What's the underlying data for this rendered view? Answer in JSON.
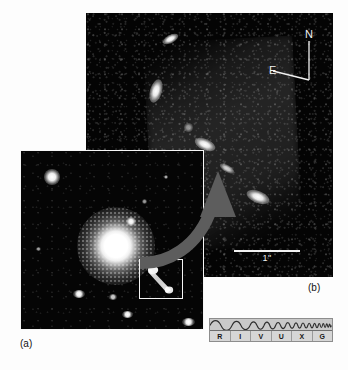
{
  "figure": {
    "type": "astronomical-image-figure",
    "panels": [
      {
        "id": "a",
        "label": "(a)",
        "caption_label": "(a)",
        "description": "Wide-field optical image of a bright elliptical galaxy with diffuse halo, surrounding field stars, and a white rectangular selection box marking the jet region",
        "background_color": "#050505",
        "selection_box_color": "#f4f4f4",
        "features": {
          "galaxy_core": "bright saturated nucleus",
          "halo": "diffuse mottled envelope",
          "selection_box": "white rectangle around jet",
          "field_stars": 9
        }
      },
      {
        "id": "b",
        "label": "(b)",
        "caption_label": "(b)",
        "description": "High-resolution zoom of the jet showing discrete bright knots strung along a diagonal ridge from upper-left to lower-right on a noisy dark background",
        "background_color": "#040404",
        "knot_count": 6
      }
    ],
    "compass": {
      "north_label": "N",
      "east_label": "E",
      "color": "#f2f2f2"
    },
    "scalebar": {
      "label": "1\"",
      "value": 1,
      "unit": "arcsec",
      "color": "#f0f0f0"
    },
    "callout_arrow": {
      "from_panel": "a",
      "to_panel": "b",
      "color": "#5d5d5d",
      "style": "curved-thick-arrow"
    },
    "spectrum_bar": {
      "title": "electromagnetic spectrum indicator",
      "bands": [
        {
          "label": "R",
          "name": "Radio"
        },
        {
          "label": "I",
          "name": "Infrared"
        },
        {
          "label": "V",
          "name": "Visible"
        },
        {
          "label": "U",
          "name": "Ultraviolet"
        },
        {
          "label": "X",
          "name": "X-ray"
        },
        {
          "label": "G",
          "name": "Gamma ray"
        }
      ],
      "highlighted_band": "V",
      "wave_description": "sine wave with frequency increasing left to right",
      "fill_color": "#cfcfcf",
      "border_color": "#8d8d8d",
      "wave_color": "#2e2e2e"
    }
  }
}
